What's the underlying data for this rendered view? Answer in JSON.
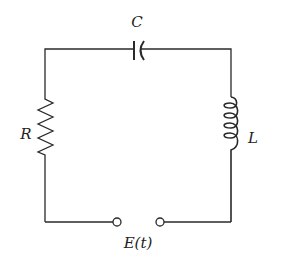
{
  "diagram": {
    "type": "circuit",
    "components": [
      {
        "id": "capacitor",
        "label": "C",
        "position": "top"
      },
      {
        "id": "resistor",
        "label": "R",
        "position": "left"
      },
      {
        "id": "inductor",
        "label": "L",
        "position": "right"
      },
      {
        "id": "source",
        "label": "E(t)",
        "position": "bottom"
      }
    ],
    "colors": {
      "line": "#2a2a2a",
      "background": "#ffffff"
    }
  }
}
